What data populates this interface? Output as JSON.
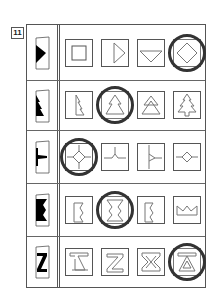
{
  "question": {
    "number": "11",
    "rows": [
      {
        "target_icon": "triangle-right-icon",
        "options": [
          "square-in-square-icon",
          "triangle-right-outline-icon",
          "triangle-down-outline-icon",
          "diamond-in-square-icon"
        ],
        "selected_index": 3
      },
      {
        "target_icon": "half-tree-icon",
        "options": [
          "half-tree-outline-icon",
          "tree-two-tier-icon",
          "tree-two-tier-stacked-icon",
          "tree-three-tier-icon"
        ],
        "selected_index": 1
      },
      {
        "target_icon": "half-cross-junction-icon",
        "options": [
          "diamond-cross-icon",
          "t-junction-icon",
          "y-junction-icon",
          "small-diamond-line-icon"
        ],
        "selected_index": 0
      },
      {
        "target_icon": "zigzag-edge-icon",
        "options": [
          "half-zigzag-left-icon",
          "hourglass-zigzag-icon",
          "half-zigzag-right-icon",
          "crown-zigzag-icon"
        ],
        "selected_index": 1
      },
      {
        "target_icon": "z-shape-icon",
        "options": [
          "z-triangle-icon",
          "z-outline-icon",
          "hourglass-x-icon",
          "triangle-bar-icon"
        ],
        "selected_index": 3
      }
    ]
  },
  "colors": {
    "line": "#555555",
    "fill": "#000000",
    "circle": "#333333"
  }
}
